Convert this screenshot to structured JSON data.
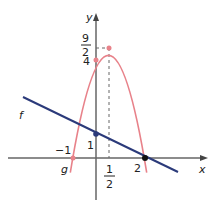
{
  "graph": {
    "axes": {
      "x_label": "x",
      "y_label": "y"
    },
    "functions": {
      "f": {
        "label": "f",
        "type": "line",
        "through": [
          [
            0,
            1
          ],
          [
            2,
            0
          ]
        ],
        "color": "#2b3a7a"
      },
      "g": {
        "label": "g",
        "type": "parabola",
        "expression": "-2(x+1)(x-2)",
        "vertex": [
          0.5,
          4.5
        ],
        "roots": [
          -1,
          2
        ],
        "y_intercept": 4,
        "color": "#e8828a"
      }
    },
    "tick_labels": {
      "minus_one": "−1",
      "one": "1",
      "two": "2",
      "four": "4",
      "half_num": "1",
      "half_den": "2",
      "nine_halves_num": "9",
      "nine_halves_den": "2"
    },
    "colors": {
      "axis": "#555555",
      "dashed": "#555555"
    }
  }
}
